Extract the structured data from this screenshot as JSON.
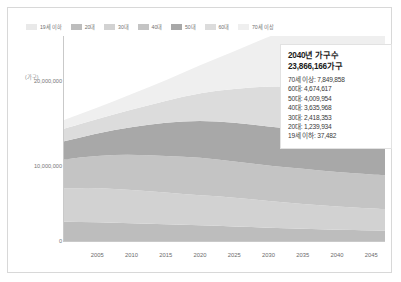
{
  "legend": {
    "items": [
      {
        "label": "19세 이하",
        "color": "#e9e9e9"
      },
      {
        "label": "20대",
        "color": "#bdbdbd"
      },
      {
        "label": "30대",
        "color": "#d2d2d2"
      },
      {
        "label": "40대",
        "color": "#c4c4c4"
      },
      {
        "label": "50대",
        "color": "#a8a8a8"
      },
      {
        "label": "60대",
        "color": "#dcdcdc"
      },
      {
        "label": "70세 이상",
        "color": "#efefef"
      }
    ]
  },
  "axes": {
    "unit_label": "(가구)",
    "y_ticks": [
      "20,000,000",
      "10,000,000",
      "0"
    ],
    "x_ticks": [
      "2005",
      "2010",
      "2015",
      "2020",
      "2025",
      "2030",
      "2035",
      "2040",
      "2045"
    ]
  },
  "infobox": {
    "title": "2040년 가구수",
    "total": "23,866,166가구",
    "rows": [
      "70세 이상: 7,849,858",
      "60대: 4,674,617",
      "50대: 4,009,954",
      "40대: 3,635,968",
      "30대: 2,418,353",
      "20대: 1,239,934",
      "19세 이하: 37,482"
    ]
  },
  "chart_data": {
    "type": "area",
    "xlabel": "",
    "ylabel": "(가구)",
    "ylim": [
      0,
      20000000
    ],
    "grid": false,
    "legend_position": "top-left",
    "stacked": true,
    "x": [
      2000,
      2005,
      2010,
      2015,
      2020,
      2025,
      2030,
      2035,
      2040,
      2045,
      2047
    ],
    "series": [
      {
        "name": "19세 이하",
        "color": "#e9e9e9",
        "values": [
          62000,
          60000,
          56000,
          52000,
          48000,
          45000,
          42000,
          40000,
          37482,
          35000,
          34000
        ]
      },
      {
        "name": "20대",
        "color": "#bdbdbd",
        "values": [
          2050000,
          2000000,
          1900000,
          1800000,
          1720000,
          1600000,
          1450000,
          1330000,
          1239934,
          1180000,
          1160000
        ]
      },
      {
        "name": "30대",
        "color": "#d2d2d2",
        "values": [
          3500000,
          3600000,
          3500000,
          3300000,
          3150000,
          3000000,
          2800000,
          2600000,
          2418353,
          2300000,
          2260000
        ]
      },
      {
        "name": "40대",
        "color": "#c4c4c4",
        "values": [
          3000000,
          3400000,
          3700000,
          3850000,
          3900000,
          3800000,
          3700000,
          3680000,
          3635968,
          3560000,
          3530000
        ]
      },
      {
        "name": "50대",
        "color": "#a8a8a8",
        "values": [
          1900000,
          2300000,
          2900000,
          3500000,
          3900000,
          4050000,
          4100000,
          4050000,
          4009954,
          3960000,
          3930000
        ]
      },
      {
        "name": "60대",
        "color": "#dcdcdc",
        "values": [
          1300000,
          1500000,
          1800000,
          2250000,
          2900000,
          3550000,
          4200000,
          4500000,
          4674617,
          4600000,
          4560000
        ]
      },
      {
        "name": "70세 이상",
        "color": "#efefef",
        "values": [
          900000,
          1200000,
          1600000,
          2150000,
          2900000,
          3900000,
          5200000,
          6600000,
          7849858,
          8900000,
          9200000
        ]
      }
    ],
    "totals_note": "2040 total: 23,866,166"
  }
}
